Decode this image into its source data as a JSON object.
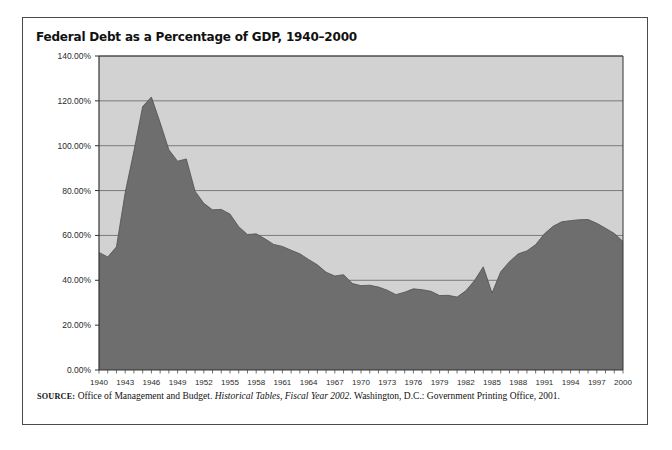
{
  "figure": {
    "title": "Federal Debt as a Percentage of GDP, 1940–2000",
    "source_prefix": "SOURCE:",
    "source_text_1": " Office of Management and Budget. ",
    "source_italic": "Historical Tables, Fiscal Year 2002",
    "source_text_2": ". Washington, D.C.: Government Printing Office, 2001.",
    "colors": {
      "plot_background": "#d2d2d2",
      "area_fill": "#6e6e6e",
      "gridline": "#555555",
      "axis": "#333333",
      "frame": "#4a4a4a"
    }
  },
  "chart_data": {
    "type": "area",
    "title": "Federal Debt as a Percentage of GDP, 1940–2000",
    "xlabel": "",
    "ylabel": "",
    "ylim": [
      0,
      140
    ],
    "ytick_values": [
      0,
      20,
      40,
      60,
      80,
      100,
      120,
      140
    ],
    "ytick_labels": [
      "0.00%",
      "20.00%",
      "40.00%",
      "60.00%",
      "80.00%",
      "100.00%",
      "120.00%",
      "140.00%"
    ],
    "xlim": [
      1940,
      2000
    ],
    "xtick_labels": [
      "1940",
      "1943",
      "1946",
      "1949",
      "1952",
      "1955",
      "1958",
      "1961",
      "1964",
      "1967",
      "1970",
      "1973",
      "1976",
      "1979",
      "1982",
      "1985",
      "1988",
      "1991",
      "1994",
      "1997",
      "2000"
    ],
    "xtick_step_years": 3,
    "minor_ticks_every_year": true,
    "grid": true,
    "legend": null,
    "x": [
      1940,
      1941,
      1942,
      1943,
      1944,
      1945,
      1946,
      1947,
      1948,
      1949,
      1950,
      1951,
      1952,
      1953,
      1954,
      1955,
      1956,
      1957,
      1958,
      1959,
      1960,
      1961,
      1962,
      1963,
      1964,
      1965,
      1966,
      1967,
      1968,
      1969,
      1970,
      1971,
      1972,
      1973,
      1974,
      1975,
      1976,
      1977,
      1978,
      1979,
      1980,
      1981,
      1982,
      1983,
      1984,
      1985,
      1986,
      1987,
      1988,
      1989,
      1990,
      1991,
      1992,
      1993,
      1994,
      1995,
      1996,
      1997,
      1998,
      1999,
      2000
    ],
    "values": [
      52.4,
      50.4,
      54.9,
      79.1,
      97.6,
      117.5,
      121.7,
      110.3,
      98.2,
      93.1,
      94.1,
      79.7,
      74.3,
      71.4,
      71.6,
      69.5,
      63.9,
      60.4,
      60.7,
      58.5,
      56.0,
      55.1,
      53.4,
      51.8,
      49.3,
      46.9,
      43.6,
      41.9,
      42.5,
      38.6,
      37.6,
      37.8,
      37.0,
      35.6,
      33.6,
      34.7,
      36.2,
      35.8,
      35.1,
      33.2,
      33.3,
      32.5,
      35.3,
      39.9,
      46.0,
      34.3,
      43.8,
      48.3,
      51.8,
      53.1,
      55.9,
      60.7,
      64.1,
      66.1,
      66.6,
      67.0,
      67.1,
      65.4,
      63.2,
      60.9,
      57.3
    ]
  }
}
